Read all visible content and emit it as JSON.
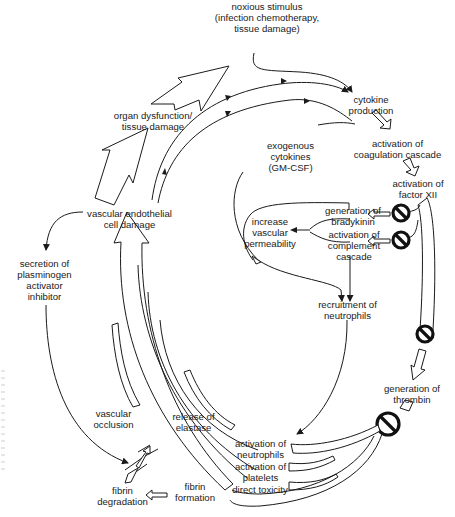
{
  "diagram": {
    "type": "cyclic pathophysiology flow diagram",
    "nodes": {
      "noxious_stimulus": "noxious stimulus\n(infection chemotherapy,\ntissue damage)",
      "cytokine_production": "cytokine\nproduction",
      "activation_coagulation": "activation of\ncoagulation cascade",
      "exogenous_cytokines": "exogenous\ncytokines\n(GM-CSF)",
      "activation_factor_xii": "activation of\nfactor XII",
      "generation_bradykinin": "generation of\nbradykinin",
      "activation_complement": "activation of\ncomplement\ncascade",
      "increase_permeability": "increase\nvascular\npermeability",
      "recruitment_neutrophils": "recruitment of\nneutrophils",
      "generation_thrombin": "generation of\nthrombin",
      "activation_neutrophils": "activation of\nneutrophils",
      "activation_platelets": "activation of\nplatelets",
      "direct_toxicity": "direct toxicity",
      "release_elastase": "release of\nelastase",
      "vascular_occlusion": "vascular\nocclusion",
      "fibrin_formation": "fibrin\nformation",
      "fibrin_degradation": "fibrin\ndegradation",
      "secretion_pai": "secretion of\nplasminogen\nactivator\ninhibitor",
      "vascular_endothelial_damage": "vascular endothelial\ncell damage",
      "organ_dysfunction": "organ dysfunction/\ntissue damage"
    },
    "inhibition_symbols": [
      {
        "name": "inhibit-bradykinin",
        "target": "generation of bradykinin"
      },
      {
        "name": "inhibit-complement",
        "target": "activation of complement cascade"
      },
      {
        "name": "inhibit-factor-xii-to-thrombin",
        "target": "generation of thrombin"
      },
      {
        "name": "inhibit-thrombin-outputs",
        "target": "activation of neutrophils / platelets / direct toxicity"
      }
    ],
    "colors": {
      "line": "#1a1a1a",
      "background": "#ffffff",
      "inhibitor": "#111111"
    }
  }
}
